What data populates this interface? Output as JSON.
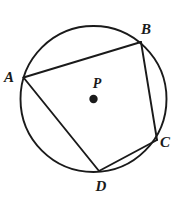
{
  "figure": {
    "type": "circle-with-inscribed-quadrilateral",
    "background_color": "#ffffff",
    "stroke_color": "#1a1a1a",
    "label_color": "#1a1a1a",
    "circle": {
      "center_label": "P",
      "center_x": 93.5,
      "center_y": 99,
      "radius": 73,
      "stroke_width": 1.9
    },
    "center_dot": {
      "x": 93.5,
      "y": 99,
      "radius": 4.2
    },
    "center_label_pos": {
      "x": 97,
      "y": 88
    },
    "vertices": [
      {
        "label": "A",
        "x": 23.5,
        "y": 77.5,
        "label_x": 9,
        "label_y": 82
      },
      {
        "label": "B",
        "x": 141,
        "y": 42,
        "label_x": 143,
        "label_y": 34
      },
      {
        "label": "C",
        "x": 157,
        "y": 140,
        "label_x": 161,
        "label_y": 147
      },
      {
        "label": "D",
        "x": 99,
        "y": 171,
        "label_x": 97,
        "label_y": 192
      }
    ],
    "chords": [
      {
        "name": "chord-ab",
        "from": "A",
        "to": "B",
        "x1": 23.5,
        "y1": 77.5,
        "x2": 141,
        "y2": 42
      },
      {
        "name": "chord-bc",
        "from": "B",
        "to": "C",
        "x1": 141,
        "y1": 42,
        "x2": 157,
        "y2": 140
      },
      {
        "name": "chord-cd",
        "from": "C",
        "to": "D",
        "x1": 157,
        "y1": 140,
        "x2": 99,
        "y2": 171
      },
      {
        "name": "chord-da",
        "from": "D",
        "to": "A",
        "x1": 99,
        "y1": 171,
        "x2": 23.5,
        "y2": 77.5
      }
    ],
    "stroke_width": 1.9
  }
}
